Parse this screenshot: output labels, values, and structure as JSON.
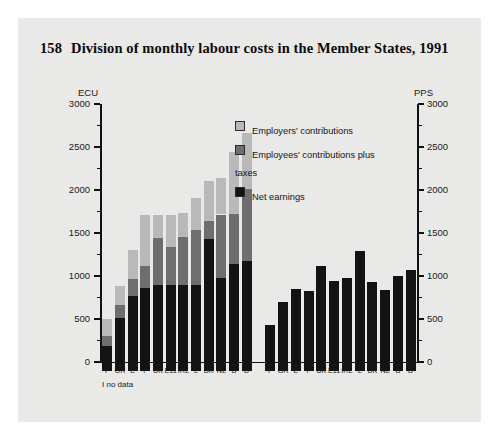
{
  "figure": {
    "number": "158",
    "title": "Division of monthly labour costs in the Member States, 1991",
    "footnote": "I no data"
  },
  "legend": {
    "items": [
      {
        "label": "Employers' contributions",
        "color": "#b9b9b9",
        "key": "employers"
      },
      {
        "label": "Employees' contributions plus taxes",
        "color": "#6e6e6e",
        "key": "employees_taxes"
      },
      {
        "label": "Net earnings",
        "color": "#131313",
        "key": "net_earnings"
      }
    ]
  },
  "axes": {
    "left_unit": "ECU",
    "right_unit": "PPS",
    "ticks": [
      "3000",
      "2500",
      "2000",
      "1500",
      "1000",
      "500",
      "0"
    ]
  },
  "chart_data": {
    "type": "bar",
    "title": "Division of monthly labour costs in the Member States, 1991",
    "subtitle": "",
    "xlabel": "",
    "ylabel": "ECU",
    "ylim": [
      0,
      3000
    ],
    "ytick_step": 500,
    "minor_tick_step": 250,
    "grid": false,
    "legend_position": "inside-top-center",
    "annotations": [
      "I no data"
    ],
    "panels": [
      {
        "name": "ECU",
        "unit": "ECU",
        "stacked": true,
        "categories": [
          "P",
          "GR",
          "E",
          "F",
          "UK",
          "E11",
          "IRL",
          "L",
          "DK",
          "NL",
          "B",
          "D"
        ],
        "series": [
          {
            "name": "Net earnings",
            "color": "#131313",
            "values": [
              290,
              620,
              870,
              970,
              1000,
              1000,
              1000,
              1000,
              1540,
              1080,
              1250,
              1280
            ]
          },
          {
            "name": "Employees' contributions plus taxes",
            "color": "#6e6e6e",
            "values": [
              120,
              150,
              200,
              250,
              550,
              440,
              560,
              640,
              210,
              740,
              570,
              840
            ]
          },
          {
            "name": "Employers' contributions",
            "color": "#b9b9b9",
            "values": [
              190,
              220,
              340,
              600,
              260,
              370,
              280,
              370,
              460,
              430,
              730,
              650
            ]
          }
        ],
        "totals": [
          600,
          990,
          1410,
          1820,
          1810,
          1810,
          1840,
          2010,
          2210,
          2250,
          2550,
          2770
        ]
      },
      {
        "name": "PPS",
        "unit": "PPS",
        "stacked": false,
        "categories": [
          "P",
          "GR",
          "E",
          "F",
          "UK",
          "E11",
          "IRL",
          "L",
          "DK",
          "NL",
          "B",
          "D"
        ],
        "series": [
          {
            "name": "Net earnings",
            "color": "#131313",
            "values": [
              540,
              800,
              950,
              930,
              1220,
              1050,
              1080,
              1400,
              1030,
              940,
              1100,
              1170
            ]
          }
        ]
      }
    ]
  }
}
